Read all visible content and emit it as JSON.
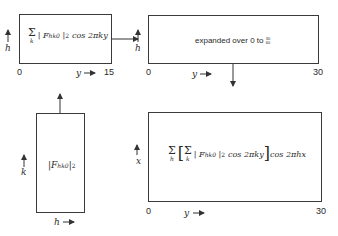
{
  "boxes": {
    "box1": {
      "formula": {
        "sum_index": "k",
        "F": "F",
        "F_sub": "hk0",
        "power": "2",
        "tail": "cos 2πky"
      },
      "vertical_axis": "h",
      "x_start": "0",
      "x_axis": "y",
      "x_end": "15"
    },
    "box2": {
      "text": "expanded over 0 to",
      "frac_num": "30",
      "frac_den": "60",
      "vertical_axis": "h",
      "x_start": "0",
      "x_axis": "y",
      "x_end": "30"
    },
    "box3": {
      "formula": {
        "F": "F",
        "F_sub": "hk0",
        "power": "2"
      },
      "vertical_axis": "k",
      "h_axis": "h"
    },
    "box4": {
      "formula": {
        "outer_sum_index": "h",
        "inner_sum_index": "k",
        "F": "F",
        "F_sub": "hk0",
        "power": "2",
        "inner_tail": "cos 2πky",
        "outer_tail": "cos 2πhx"
      },
      "vertical_axis": "x",
      "x_start": "0",
      "x_axis": "y",
      "x_end": "30"
    }
  },
  "sigma": "Σ"
}
